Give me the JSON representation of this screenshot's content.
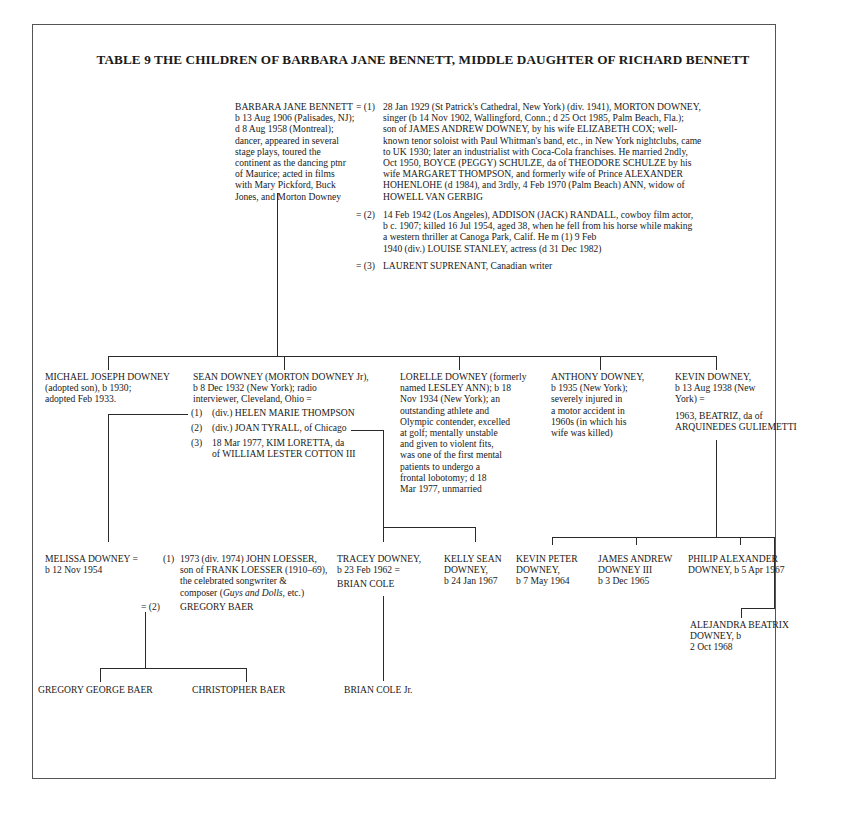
{
  "title": "TABLE 9 THE CHILDREN OF BARBARA JANE BENNETT, MIDDLE DAUGHTER OF RICHARD BENNETT",
  "root": {
    "name": "BARBARA JANE BENNETT",
    "details": [
      "b 13 Aug 1906 (Palisades, NJ);",
      "d 8 Aug 1958 (Montreal);",
      "dancer, appeared in several",
      "stage plays, toured the",
      "continent as the dancing ptnr",
      "of Maurice; acted in films",
      "with Mary Pickford, Buck",
      "Jones, and Morton Downey"
    ],
    "marriages": [
      {
        "marker": "= (1)",
        "lines": [
          "28 Jan 1929 (St Patrick's Cathedral, New York) (div. 1941), MORTON DOWNEY,",
          "singer (b 14 Nov 1902, Wallingford, Conn.; d 25 Oct 1985, Palm Beach, Fla.);",
          "son of JAMES ANDREW DOWNEY, by his wife ELIZABETH COX; well-",
          "known tenor soloist with Paul Whitman's band, etc., in New York nightclubs, came",
          "to UK 1930; later an industrialist with Coca-Cola franchises. He married 2ndly,",
          "Oct 1950, BOYCE (PEGGY) SCHULZE, da of THEODORE SCHULZE by his",
          "wife MARGARET THOMPSON, and formerly wife of Prince ALEXANDER",
          "HOHENLOHE (d 1984), and 3rdly, 4 Feb 1970 (Palm Beach) ANN, widow of",
          "HOWELL VAN GERBIG"
        ]
      },
      {
        "marker": "= (2)",
        "lines": [
          "14 Feb 1942 (Los Angeles), ADDISON (JACK) RANDALL, cowboy film actor,",
          "b c. 1907; killed 16 Jul 1954, aged 38, when he fell from his horse while making",
          "a western thriller at Canoga Park, Calif. He m (1) 9 Feb",
          "1940 (div.) LOUISE STANLEY, actress (d 31 Dec 1982)"
        ]
      },
      {
        "marker": "= (3)",
        "lines": [
          "LAURENT SUPRENANT, Canadian writer"
        ]
      }
    ]
  },
  "children": [
    {
      "id": "michael",
      "lines": [
        "MICHAEL JOSEPH DOWNEY",
        "(adopted son), b 1930;",
        "adopted Feb 1933."
      ]
    },
    {
      "id": "sean",
      "lines": [
        "SEAN DOWNEY (MORTON DOWNEY Jr),",
        "b 8 Dec 1932 (New York); radio",
        "interviewer, Cleveland, Ohio ="
      ],
      "marriages": [
        {
          "marker": "(1)",
          "text": "(div.) HELEN MARIE THOMPSON"
        },
        {
          "marker": "(2)",
          "text": "(div.) JOAN TYRALL, of Chicago"
        },
        {
          "marker": "(3)",
          "lines": [
            "18 Mar 1977, KIM LORETTA, da",
            "of WILLIAM LESTER COTTON III"
          ]
        }
      ]
    },
    {
      "id": "lorelle",
      "lines": [
        "LORELLE DOWNEY (formerly",
        "named LESLEY ANN); b 18",
        "Nov 1934 (New York); an",
        "outstanding athlete and",
        "Olympic contender, excelled",
        "at golf; mentally unstable",
        "and given to violent fits,",
        "was one of the first mental",
        "patients to undergo a",
        "frontal lobotomy; d 18",
        "Mar 1977, unmarried"
      ]
    },
    {
      "id": "anthony",
      "lines": [
        "ANTHONY DOWNEY,",
        "b 1935 (New York);",
        "severely injured in",
        "a motor accident in",
        "1960s (in which his",
        "wife was killed)"
      ]
    },
    {
      "id": "kevin",
      "lines": [
        "KEVIN DOWNEY,",
        "b 13 Aug 1938 (New",
        "York) ="
      ],
      "spouse": [
        "1963, BEATRIZ, da of",
        "ARQUINEDES GULIEMETTI"
      ]
    }
  ],
  "grandchildren": {
    "melissa": {
      "lines": [
        "MELISSA DOWNEY =",
        "b 12 Nov 1954"
      ],
      "marriages": [
        {
          "marker": "(1)",
          "lines": [
            "1973 (div. 1974) JOHN LOESSER,",
            "son of FRANK LOESSER (1910–69),",
            "the celebrated songwriter &",
            "composer (Guys and Dolls, etc.)"
          ]
        },
        {
          "marker": "= (2)",
          "text": "GREGORY BAER"
        }
      ]
    },
    "tracey": {
      "lines": [
        "TRACEY DOWNEY,",
        "b 23 Feb 1962 =",
        "BRIAN COLE"
      ]
    },
    "kelly": {
      "lines": [
        "KELLY SEAN",
        "DOWNEY,",
        "b 24 Jan 1967"
      ]
    },
    "kevin_peter": {
      "lines": [
        "KEVIN PETER",
        "DOWNEY,",
        "b 7 May 1964"
      ]
    },
    "james": {
      "lines": [
        "JAMES ANDREW",
        "DOWNEY III",
        "b 3 Dec 1965"
      ]
    },
    "philip": {
      "lines": [
        "PHILIP ALEXANDER",
        "DOWNEY, b 5 Apr 1967"
      ]
    },
    "alejandra": {
      "lines": [
        "ALEJANDRA BEATRIX",
        "DOWNEY, b",
        "2 Oct 1968"
      ]
    }
  },
  "great_grandchildren": [
    {
      "name": "GREGORY GEORGE BAER"
    },
    {
      "name": "CHRISTOPHER BAER"
    },
    {
      "name": "BRIAN COLE Jr."
    }
  ]
}
